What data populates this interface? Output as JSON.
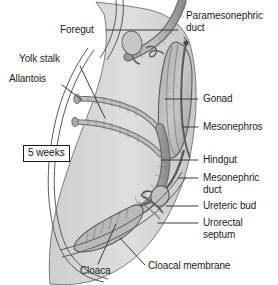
{
  "figure": {
    "stage_badge": "5 weeks",
    "background_color": "#ffffff",
    "tissue_fill": "#d8d8d8",
    "organ_fill": "#b3b3b3",
    "outline_color": "#4a4a4a",
    "label_color": "#1d1d1d",
    "leader_color": "#303030"
  },
  "labels": {
    "foregut": "Foregut",
    "yolk_stalk": "Yolk stalk",
    "allantois": "Allantois",
    "paramesonephric_duct_line1": "Paramesonephric",
    "paramesonephric_duct_line2": "duct",
    "gonad": "Gonad",
    "mesonephros": "Mesonephros",
    "hindgut": "Hindgut",
    "mesonephric_duct_line1": "Mesonephric",
    "mesonephric_duct_line2": "duct",
    "ureteric_bud": "Ureteric bud",
    "urorectal_septum_line1": "Urorectal",
    "urorectal_septum_line2": "septum",
    "cloacal_membrane": "Cloacal membrane",
    "cloaca": "Cloaca"
  }
}
